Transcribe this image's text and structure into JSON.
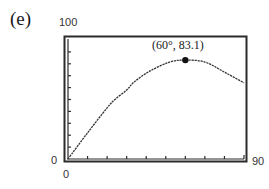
{
  "panel": {
    "label": "(e)"
  },
  "axes": {
    "y_max_label": "100",
    "y_min_label": "0",
    "x_min_label": "0",
    "x_max_label": "90"
  },
  "annotation": {
    "text": "(60°, 83.1)"
  },
  "colors": {
    "frame": "#2b2b2b",
    "curve": "#333333",
    "point": "#111111",
    "background": "#ffffff"
  },
  "chart_data": {
    "type": "line",
    "title": "(e)",
    "xlabel": "",
    "ylabel": "",
    "xlim": [
      0,
      90
    ],
    "ylim": [
      0,
      100
    ],
    "grid": false,
    "legend": null,
    "x_tick_step": 10,
    "y_tick_step": 10,
    "series": [
      {
        "name": "curve",
        "style": "dotted",
        "x": [
          0,
          10,
          20,
          24,
          30,
          34,
          42,
          52,
          60,
          70,
          80,
          90
        ],
        "y": [
          0,
          22,
          43,
          50,
          58,
          65,
          74,
          81.5,
          83.1,
          81.5,
          73,
          64
        ]
      }
    ],
    "annotations": [
      {
        "x": 60,
        "y": 83.1,
        "text": "(60°, 83.1)",
        "marker": "filled-circle"
      }
    ]
  }
}
